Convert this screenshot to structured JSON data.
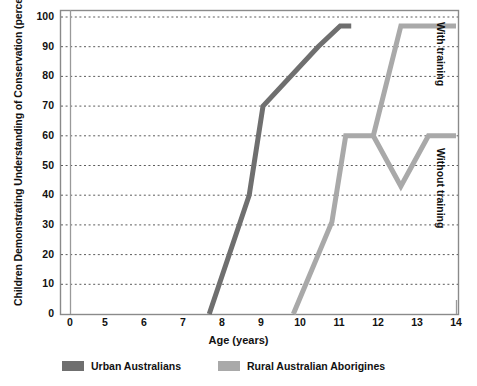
{
  "chart_data": {
    "type": "line",
    "title": "",
    "xlabel": "Age (years)",
    "ylabel": "Children Demonstrating Understanding of Conservation (percent)",
    "xlim": [
      0,
      14
    ],
    "ylim": [
      0,
      100
    ],
    "grid": true,
    "legend_position": "bottom",
    "xticks": [
      "0",
      "5",
      "6",
      "7",
      "8",
      "9",
      "10",
      "11",
      "12",
      "13",
      "14"
    ],
    "yticks": [
      "0",
      "10",
      "20",
      "30",
      "40",
      "50",
      "60",
      "70",
      "80",
      "90",
      "100"
    ],
    "series": [
      {
        "name": "Urban Australians",
        "color": "#6f6f6f",
        "x": [
          5.05,
          6.5,
          7.0,
          9.0,
          9.8,
          10.2
        ],
        "values": [
          0,
          40,
          70,
          90,
          97,
          97
        ]
      },
      {
        "name": "Rural Australian Aborigines",
        "color": "#a9a9a9",
        "x": [
          8.1,
          9.5,
          10.0,
          11.0
        ],
        "values": [
          0,
          31,
          60,
          60
        ],
        "note": "common trunk before branch"
      },
      {
        "name": "Rural Australian Aborigines - With training",
        "color": "#a9a9a9",
        "x": [
          11.0,
          12.0,
          14.0
        ],
        "values": [
          60,
          97,
          97
        ],
        "branch": "with-training"
      },
      {
        "name": "Rural Australian Aborigines - Without training",
        "color": "#a9a9a9",
        "x": [
          11.0,
          12.0,
          13.0,
          14.0
        ],
        "values": [
          60,
          43,
          60,
          60
        ],
        "branch": "without-training"
      }
    ],
    "annotations": [
      {
        "text": "With training",
        "position": "right-upper"
      },
      {
        "text": "Without training",
        "position": "right-lower"
      }
    ]
  },
  "axis": {
    "ylabel": "Children Demonstrating Understanding of Conservation (percent)",
    "xlabel": "Age (years)",
    "yticks": [
      {
        "label": "100",
        "y": 17
      },
      {
        "label": "90",
        "y": 46.7
      },
      {
        "label": "80",
        "y": 76.4
      },
      {
        "label": "70",
        "y": 106.1
      },
      {
        "label": "60",
        "y": 135.8
      },
      {
        "label": "50",
        "y": 165.5
      },
      {
        "label": "40",
        "y": 195.2
      },
      {
        "label": "30",
        "y": 224.9
      },
      {
        "label": "20",
        "y": 254.6
      },
      {
        "label": "10",
        "y": 284.3
      },
      {
        "label": "0",
        "y": 314
      }
    ],
    "xticks": [
      {
        "label": "0",
        "x": 70
      },
      {
        "label": "5",
        "x": 105
      },
      {
        "label": "6",
        "x": 144
      },
      {
        "label": "7",
        "x": 183
      },
      {
        "label": "8",
        "x": 222
      },
      {
        "label": "9",
        "x": 261
      },
      {
        "label": "10",
        "x": 300
      },
      {
        "label": "11",
        "x": 339
      },
      {
        "label": "12",
        "x": 378
      },
      {
        "label": "13",
        "x": 417
      },
      {
        "label": "14",
        "x": 456
      }
    ]
  },
  "annotations": {
    "with_training": "With training",
    "without_training": "Without training"
  },
  "legend": {
    "items": [
      {
        "label": "Urban Australians",
        "color": "#6f6f6f"
      },
      {
        "label": "Rural Australian Aborigines",
        "color": "#a9a9a9"
      }
    ]
  },
  "colors": {
    "urban": "#6f6f6f",
    "rural": "#a9a9a9",
    "frame": "#8a8a8a",
    "grid": "#4a4a4a",
    "text": "#111111"
  }
}
